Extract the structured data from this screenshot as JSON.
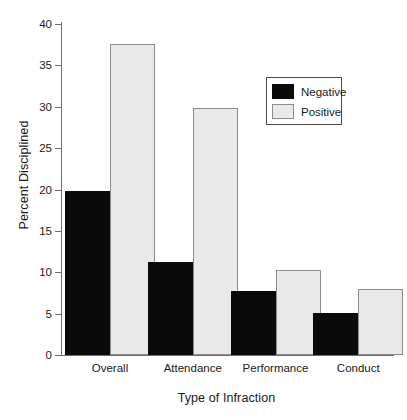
{
  "chart_data": {
    "type": "bar",
    "title": "",
    "subtitle": "",
    "xlabel": "Type of Infraction",
    "ylabel": "Percent Disciplined",
    "categories": [
      "Overall",
      "Attendance",
      "Performance",
      "Conduct"
    ],
    "series": [
      {
        "name": "Negative",
        "color": "#0a0a0a",
        "values": [
          19.8,
          11.2,
          7.7,
          5.1
        ]
      },
      {
        "name": "Positive",
        "color": "#e9e9e9",
        "values": [
          37.6,
          29.8,
          10.3,
          8.0
        ]
      }
    ],
    "ylim": [
      0,
      40
    ],
    "yticks": [
      0,
      5,
      10,
      15,
      20,
      25,
      30,
      35,
      40
    ],
    "ytick_labels": [
      "0",
      "5",
      "10",
      "15",
      "20",
      "25",
      "30",
      "35",
      "40"
    ],
    "grid": false,
    "legend_position": "upper right",
    "legend_entries": [
      "Negative",
      "Positive"
    ],
    "annotations": []
  }
}
